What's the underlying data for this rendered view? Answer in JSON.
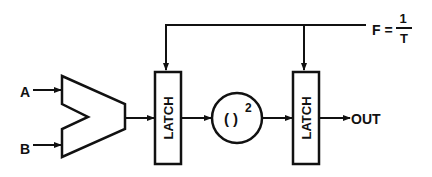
{
  "diagram": {
    "type": "block-diagram",
    "inputs": [
      {
        "id": "A",
        "label": "A"
      },
      {
        "id": "B",
        "label": "B"
      }
    ],
    "blocks": [
      {
        "id": "adder",
        "label": "",
        "shape": "adder-trapezoid"
      },
      {
        "id": "latch1",
        "label": "LATCH",
        "shape": "rect"
      },
      {
        "id": "square",
        "label": "( )",
        "superscript": "2",
        "shape": "circle"
      },
      {
        "id": "latch2",
        "label": "LATCH",
        "shape": "rect"
      }
    ],
    "clock": {
      "lhs": "F =",
      "numerator": "1",
      "denominator": "T"
    },
    "output": {
      "label": "OUT"
    },
    "edges": [
      {
        "from": "A",
        "to": "adder"
      },
      {
        "from": "B",
        "to": "adder"
      },
      {
        "from": "adder",
        "to": "latch1"
      },
      {
        "from": "latch1",
        "to": "square"
      },
      {
        "from": "square",
        "to": "latch2"
      },
      {
        "from": "latch2",
        "to": "OUT"
      },
      {
        "from": "clock",
        "to": "latch1"
      },
      {
        "from": "clock",
        "to": "latch2"
      }
    ],
    "colors": {
      "stroke": "#111111",
      "background": "#ffffff"
    }
  }
}
